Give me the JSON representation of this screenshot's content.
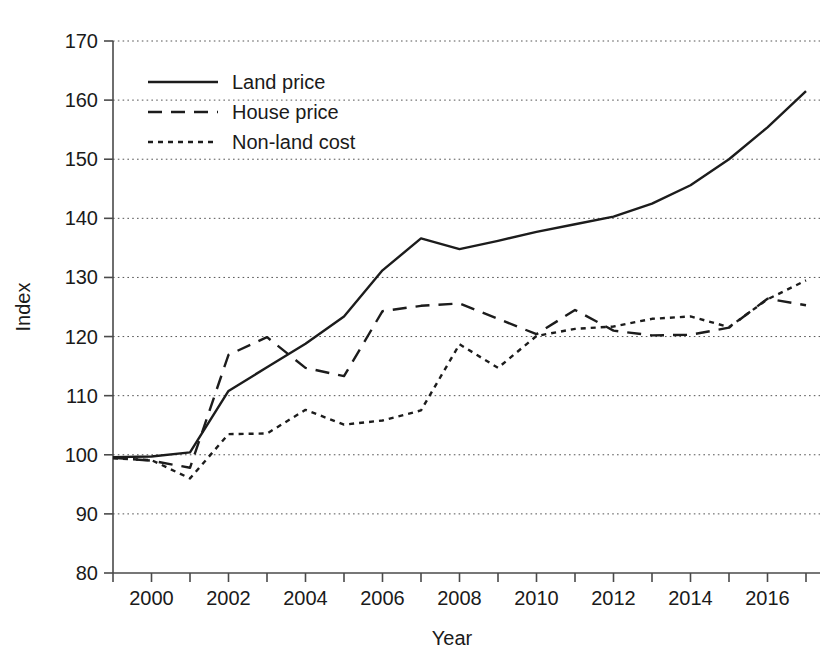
{
  "chart_data": {
    "type": "line",
    "title": "",
    "xlabel": "Year",
    "ylabel": "Index",
    "xlim": [
      1999,
      2017
    ],
    "ylim": [
      80,
      170
    ],
    "ytick_values": [
      80,
      90,
      100,
      110,
      120,
      130,
      140,
      150,
      160,
      170
    ],
    "ytick_labels": [
      "80",
      "90",
      "100",
      "110",
      "120",
      "130",
      "140",
      "150",
      "160",
      "170"
    ],
    "xtick_values": [
      2000,
      2002,
      2004,
      2006,
      2008,
      2010,
      2012,
      2014,
      2016
    ],
    "xtick_labels": [
      "2000",
      "2002",
      "2004",
      "2006",
      "2008",
      "2010",
      "2012",
      "2014",
      "2016"
    ],
    "x_minor_ticks": [
      1999,
      2000,
      2001,
      2002,
      2003,
      2004,
      2005,
      2006,
      2007,
      2008,
      2009,
      2010,
      2011,
      2012,
      2013,
      2014,
      2015,
      2016,
      2017
    ],
    "grid": true,
    "grid_axis": "y",
    "legend_position": "top-left",
    "x": [
      1999,
      2000,
      2001,
      2002,
      2003,
      2004,
      2005,
      2006,
      2007,
      2008,
      2009,
      2010,
      2011,
      2012,
      2013,
      2014,
      2015,
      2016,
      2017
    ],
    "series": [
      {
        "name": "Land price",
        "style": "solid",
        "color": "#1c1c1c",
        "values": [
          99.6,
          99.7,
          100.4,
          110.8,
          114.8,
          118.8,
          123.4,
          131.2,
          136.6,
          134.8,
          136.2,
          137.7,
          139.0,
          140.3,
          142.5,
          145.6,
          150.0,
          155.4,
          161.5
        ]
      },
      {
        "name": "House price",
        "style": "dashed",
        "color": "#1c1c1c",
        "values": [
          99.5,
          99.0,
          97.8,
          116.9,
          119.9,
          114.7,
          113.3,
          124.3,
          125.2,
          125.6,
          123.0,
          120.4,
          124.5,
          121.0,
          120.2,
          120.3,
          121.5,
          126.4,
          125.3
        ]
      },
      {
        "name": "Non-land cost",
        "style": "dotted",
        "color": "#1c1c1c",
        "values": [
          99.4,
          99.1,
          96.0,
          103.5,
          103.6,
          107.6,
          105.1,
          105.8,
          107.5,
          118.7,
          114.7,
          120.1,
          121.3,
          121.7,
          123.0,
          123.4,
          121.6,
          126.3,
          129.5
        ]
      }
    ]
  },
  "legend": {
    "items": [
      {
        "label": "Land price",
        "style": "solid"
      },
      {
        "label": "House price",
        "style": "dashed"
      },
      {
        "label": "Non-land cost",
        "style": "dotted"
      }
    ]
  },
  "axes": {
    "x_title": "Year",
    "y_title": "Index"
  }
}
